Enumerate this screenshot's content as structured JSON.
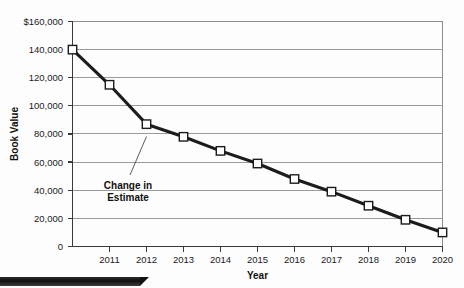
{
  "chart_data": {
    "type": "line",
    "title": "",
    "xlabel": "Year",
    "ylabel": "Book Value",
    "categories": [
      2010,
      2011,
      2012,
      2013,
      2014,
      2015,
      2016,
      2017,
      2018,
      2019,
      2020
    ],
    "x_tick_labels": [
      "2011",
      "2012",
      "2013",
      "2014",
      "2015",
      "2016",
      "2017",
      "2018",
      "2019",
      "2020"
    ],
    "y_tick_labels": [
      "0",
      "20,000",
      "40,000",
      "60,000",
      "80,000",
      "100,000",
      "120,000",
      "140,000",
      "$160,000"
    ],
    "y_tick_values": [
      0,
      20000,
      40000,
      60000,
      80000,
      100000,
      120000,
      140000,
      160000
    ],
    "values": [
      140000,
      115000,
      87000,
      78000,
      68000,
      59000,
      48000,
      39000,
      29000,
      19000,
      10000
    ],
    "series": [
      {
        "name": "Book Value",
        "values": [
          140000,
          115000,
          87000,
          78000,
          68000,
          59000,
          48000,
          39000,
          29000,
          19000,
          10000
        ]
      }
    ],
    "xlim": [
      2010,
      2020
    ],
    "ylim": [
      0,
      160000
    ],
    "grid": true,
    "legend": "none",
    "marker": "open-square",
    "annotations": [
      {
        "name": "change-in-estimate",
        "line1": "Change in",
        "line2": "Estimate",
        "points_to_year": 2012,
        "points_to_value": 87000
      }
    ],
    "colors": {
      "series_line": "#1c1c1c",
      "marker_fill": "#ffffff",
      "gridline": "#9a9a9a",
      "axis": "#3a3a3a",
      "background": "#fdfdfd"
    }
  }
}
